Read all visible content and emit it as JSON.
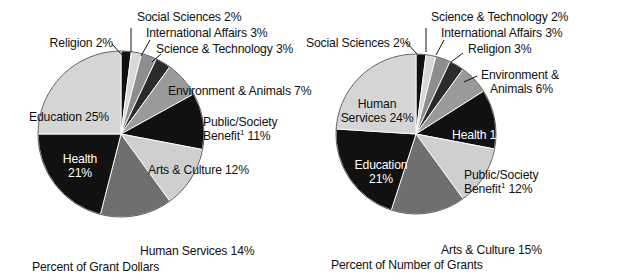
{
  "chart_data": [
    {
      "type": "pie",
      "title": "Percent of Grant Dollars",
      "caption": "Percent of Grant Dollars",
      "legend": "none",
      "start_angle_deg": 0,
      "direction": "clockwise",
      "units": "percent",
      "categories": [
        "Religion",
        "Social Sciences",
        "International Affairs",
        "Science & Technology",
        "Environment & Animals",
        "Public/Society Benefit",
        "Arts & Culture",
        "Human Services",
        "Health",
        "Education"
      ],
      "values": [
        2,
        2,
        3,
        3,
        7,
        11,
        12,
        14,
        21,
        25
      ],
      "slice_colors": [
        "#111111",
        "#d8d8d8",
        "#8e8e8e",
        "#2b2b2b",
        "#9a9a9a",
        "#111111",
        "#cfcfcf",
        "#6f6f6f",
        "#111111",
        "#d5d5d5"
      ],
      "labels": [
        "Religion 2%",
        "Social Sciences 2%",
        "International Affairs 3%",
        "Science & Technology 3%",
        "Environment & Animals 7%",
        "Public/Society Benefit¹ 11%",
        "Arts & Culture 12%",
        "Human Services 14%",
        "Health 21%",
        "Education 25%"
      ]
    },
    {
      "type": "pie",
      "title": "Percent of Number of Grants",
      "caption": "Percent of Number of Grants",
      "legend": "none",
      "start_angle_deg": 0,
      "direction": "clockwise",
      "units": "percent",
      "categories": [
        "Social Sciences",
        "Science & Technology",
        "International Affairs",
        "Religion",
        "Environment & Animals",
        "Health",
        "Public/Society Benefit",
        "Arts & Culture",
        "Education",
        "Human Services"
      ],
      "values": [
        2,
        2,
        3,
        3,
        6,
        12,
        12,
        15,
        21,
        24
      ],
      "slice_colors": [
        "#111111",
        "#d8d8d8",
        "#8e8e8e",
        "#2b2b2b",
        "#9a9a9a",
        "#111111",
        "#cfcfcf",
        "#6f6f6f",
        "#111111",
        "#d5d5d5"
      ],
      "labels": [
        "Social Sciences 2%",
        "Science & Technology 2%",
        "International Affairs 3%",
        "Religion 3%",
        "Environment & Animals 6%",
        "Health 12%",
        "Public/Society Benefit¹ 12%",
        "Arts & Culture 15%",
        "Education 21%",
        "Human Services 24%"
      ]
    }
  ],
  "left_chart": {
    "caption": "Percent of Grant Dollars",
    "callouts": {
      "religion": "Religion 2%",
      "social_sciences": "Social Sciences 2%",
      "international_affairs": "International Affairs 3%",
      "science_technology": "Science & Technology 3%",
      "environment_animals": "Environment & Animals 7%",
      "public_society_benefit_line1": "Public/Society",
      "public_society_benefit_line2_prefix": "Benefit",
      "public_society_benefit_line2_sup": "1",
      "public_society_benefit_line2_suffix": " 11%",
      "arts_culture": "Arts & Culture 12%",
      "human_services": "Human Services 14%",
      "health_line1": "Health",
      "health_line2": "21%",
      "education": "Education 25%"
    }
  },
  "right_chart": {
    "caption": "Percent of Number of Grants",
    "callouts": {
      "social_sciences": "Social Sciences 2%",
      "science_technology": "Science & Technology 2%",
      "international_affairs": "International Affairs 3%",
      "religion": "Religion 3%",
      "environment_animals_line1": "Environment &",
      "environment_animals_line2": "Animals 6%",
      "health": "Health 12%",
      "public_society_benefit_line1": "Public/Society",
      "public_society_benefit_line2_prefix": "Benefit",
      "public_society_benefit_line2_sup": "1",
      "public_society_benefit_line2_suffix": " 12%",
      "arts_culture": "Arts & Culture 15%",
      "education_line1": "Education",
      "education_line2": "21%",
      "human_services_line1": "Human",
      "human_services_line2": "Services 24%"
    }
  }
}
